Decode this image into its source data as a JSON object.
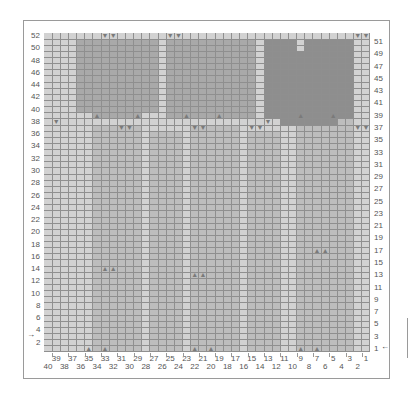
{
  "chart": {
    "title": "",
    "stitches": 40,
    "rows": 52,
    "row_labels_left": [
      52,
      50,
      48,
      46,
      44,
      42,
      40,
      38,
      36,
      34,
      32,
      30,
      28,
      26,
      24,
      22,
      20,
      18,
      16,
      14,
      12,
      10,
      8,
      6,
      4,
      2
    ],
    "row_labels_right": [
      51,
      49,
      47,
      45,
      43,
      41,
      39,
      37,
      35,
      33,
      31,
      29,
      27,
      25,
      23,
      21,
      19,
      17,
      15,
      13,
      11,
      9,
      7,
      5,
      3,
      1
    ],
    "col_labels_top_row": [
      39,
      37,
      35,
      33,
      31,
      29,
      27,
      25,
      23,
      21,
      19,
      17,
      15,
      13,
      11,
      9,
      7,
      5,
      3,
      1
    ],
    "col_labels_bottom_row": [
      40,
      38,
      36,
      34,
      32,
      30,
      28,
      26,
      24,
      22,
      20,
      18,
      16,
      14,
      12,
      10,
      8,
      6,
      4,
      2
    ],
    "start_marker_left": "→",
    "start_marker_right": "←",
    "start_row_left": 2,
    "start_row_right": 1
  },
  "colors": {
    "background": "#d2d2d2",
    "medium": "#bdbdbd",
    "dark": "#a9a9a9",
    "darkest": "#8e8e8e",
    "gridline": "#8f8f8f",
    "symbol": "#7a7a7a"
  },
  "regions": [
    {
      "shade": "medium",
      "c1": 3,
      "c2": 9,
      "r1": 1,
      "r2": 38
    },
    {
      "shade": "medium",
      "c1": 17,
      "c2": 22,
      "r1": 1,
      "r2": 37
    },
    {
      "shade": "medium",
      "c1": 29,
      "c2": 34,
      "r1": 1,
      "r2": 37
    },
    {
      "shade": "medium",
      "c1": 12,
      "c2": 15,
      "r1": 1,
      "r2": 36
    },
    {
      "shade": "medium",
      "c1": 24,
      "c2": 27,
      "r1": 1,
      "r2": 36
    },
    {
      "shade": "dark",
      "c1": 27,
      "c2": 36,
      "r1": 40,
      "r2": 51
    },
    {
      "shade": "dark",
      "c1": 15,
      "c2": 25,
      "r1": 39,
      "r2": 51
    },
    {
      "shade": "dark",
      "c1": 29,
      "c2": 34,
      "r1": 39,
      "r2": 41
    },
    {
      "shade": "darkest",
      "c1": 3,
      "c2": 13,
      "r1": 39,
      "r2": 51
    },
    {
      "shade": "darkest",
      "c1": 5,
      "c2": 11,
      "r1": 38,
      "r2": 39
    },
    {
      "shade": "background",
      "c1": 9,
      "c2": 9,
      "r1": 50,
      "r2": 52
    }
  ],
  "symbols": [
    {
      "glyph": "▼",
      "col": 33,
      "row": 52
    },
    {
      "glyph": "▼",
      "col": 32,
      "row": 52
    },
    {
      "glyph": "▼",
      "col": 25,
      "row": 52
    },
    {
      "glyph": "▼",
      "col": 24,
      "row": 52
    },
    {
      "glyph": "▼",
      "col": 2,
      "row": 52
    },
    {
      "glyph": "▼",
      "col": 1,
      "row": 52
    },
    {
      "glyph": "▼",
      "col": 39,
      "row": 38
    },
    {
      "glyph": "▼",
      "col": 13,
      "row": 38
    },
    {
      "glyph": "▼",
      "col": 31,
      "row": 37
    },
    {
      "glyph": "▼",
      "col": 30,
      "row": 37
    },
    {
      "glyph": "▼",
      "col": 22,
      "row": 37
    },
    {
      "glyph": "▼",
      "col": 21,
      "row": 37
    },
    {
      "glyph": "▼",
      "col": 15,
      "row": 37
    },
    {
      "glyph": "▼",
      "col": 14,
      "row": 37
    },
    {
      "glyph": "▼",
      "col": 2,
      "row": 37
    },
    {
      "glyph": "▼",
      "col": 1,
      "row": 37
    },
    {
      "glyph": "▲",
      "col": 34,
      "row": 39
    },
    {
      "glyph": "▲",
      "col": 29,
      "row": 39
    },
    {
      "glyph": "▲",
      "col": 23,
      "row": 39
    },
    {
      "glyph": "▲",
      "col": 19,
      "row": 39
    },
    {
      "glyph": "▲",
      "col": 9,
      "row": 39
    },
    {
      "glyph": "▲",
      "col": 5,
      "row": 39
    },
    {
      "glyph": "▲",
      "col": 33,
      "row": 14
    },
    {
      "glyph": "▲",
      "col": 32,
      "row": 14
    },
    {
      "glyph": "▲",
      "col": 22,
      "row": 13
    },
    {
      "glyph": "▲",
      "col": 21,
      "row": 13
    },
    {
      "glyph": "▲",
      "col": 7,
      "row": 17
    },
    {
      "glyph": "▲",
      "col": 6,
      "row": 17
    },
    {
      "glyph": "▲",
      "col": 35,
      "row": 1
    },
    {
      "glyph": "▲",
      "col": 33,
      "row": 1
    },
    {
      "glyph": "▲",
      "col": 22,
      "row": 1
    },
    {
      "glyph": "▲",
      "col": 20,
      "row": 1
    },
    {
      "glyph": "▲",
      "col": 9,
      "row": 1
    },
    {
      "glyph": "▲",
      "col": 7,
      "row": 1
    }
  ]
}
